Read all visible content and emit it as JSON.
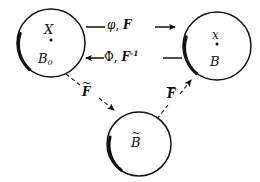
{
  "figure": {
    "type": "commutative-configuration-diagram",
    "background_color": "#ffffff",
    "stroke_color": "#111111"
  },
  "nodes": [
    {
      "id": "reference-body",
      "shape": "circle",
      "center": [
        51,
        43
      ],
      "radius": 34,
      "point_marker": true,
      "labels": {
        "top": "X",
        "bottom": "B",
        "bottom_subscript": "0"
      }
    },
    {
      "id": "current-body",
      "shape": "circle",
      "center": [
        217,
        46
      ],
      "radius": 34,
      "point_marker": true,
      "labels": {
        "top": "x",
        "bottom": "B",
        "bottom_subscript": ""
      }
    },
    {
      "id": "intermediate-body",
      "shape": "circle",
      "center": [
        139,
        144
      ],
      "radius": 32,
      "point_marker": false,
      "labels": {
        "top": "",
        "bottom": "B",
        "bottom_accent": "tilde"
      }
    }
  ],
  "arrows": [
    {
      "id": "forward-map",
      "from": "reference-body",
      "to": "current-body",
      "style": "solid",
      "direction": "right",
      "label_parts": [
        "φ",
        ", ",
        "F"
      ],
      "label_text": "φ, F"
    },
    {
      "id": "inverse-map",
      "from": "current-body",
      "to": "reference-body",
      "style": "solid",
      "direction": "left",
      "label_parts": [
        "Φ",
        ", ",
        "F",
        "-1"
      ],
      "label_text": "Φ, F⁻¹"
    },
    {
      "id": "plastic-map",
      "from": "reference-body",
      "to": "intermediate-body",
      "style": "dashed",
      "direction": "down-right",
      "label_base": "F",
      "label_accent": "tilde",
      "label_text": "F̃"
    },
    {
      "id": "elastic-map",
      "from": "intermediate-body",
      "to": "current-body",
      "style": "dashed",
      "direction": "up-right",
      "label_base": "F",
      "label_accent": "bar",
      "label_text": "F̄"
    }
  ],
  "labels": {
    "X": "X",
    "B0_base": "B",
    "B0_sub": "0",
    "x_small": "x",
    "B": "B",
    "B_tilde": "B",
    "phi": "φ",
    "comma": ", ",
    "F": "F",
    "Phi": "Φ",
    "F_inverse_sup": "-1",
    "F_tilde": "F",
    "F_bar": "F"
  }
}
